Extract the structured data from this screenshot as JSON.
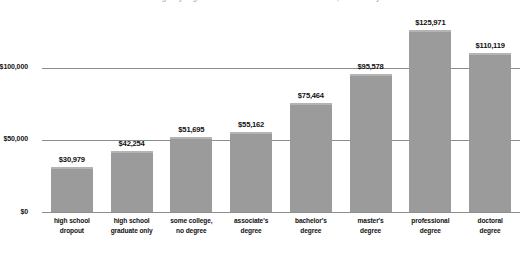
{
  "chart_data": {
    "type": "bar",
    "title": "Median annual earnings by highest level of educational attainment, full-time year-round workers",
    "xlabel": "",
    "ylabel": "",
    "ylim": [
      0,
      140000
    ],
    "yticks": [
      "$0",
      "$50,000",
      "$100,000"
    ],
    "ytick_values": [
      0,
      50000,
      100000
    ],
    "grid": true,
    "legend": "none",
    "categories": [
      "high school\ndropout",
      "high school\ngraduate only",
      "some college,\nno degree",
      "associate's\ndegree",
      "bachelor's\ndegree",
      "master's\ndegree",
      "professional\ndegree",
      "doctoral\ndegree"
    ],
    "values": [
      30979,
      42254,
      51695,
      55162,
      75464,
      95578,
      125971,
      110119
    ],
    "value_labels": [
      "$30,979",
      "$42,254",
      "$51,695",
      "$55,162",
      "$75,464",
      "$95,578",
      "$125,971",
      "$110,119"
    ]
  },
  "colors": {
    "bar_fill": "#9b9b9b",
    "bar_top_highlight": "#b4b4b4",
    "gridline": "#8d8d8d",
    "text": "#111111",
    "background": "#ffffff"
  },
  "axis": {
    "categories_lines": [
      [
        "high school",
        "dropout"
      ],
      [
        "high school",
        "graduate only"
      ],
      [
        "some college,",
        "no degree"
      ],
      [
        "associate's",
        "degree"
      ],
      [
        "bachelor's",
        "degree"
      ],
      [
        "master's",
        "degree"
      ],
      [
        "professional",
        "degree"
      ],
      [
        "doctoral",
        "degree"
      ]
    ]
  }
}
